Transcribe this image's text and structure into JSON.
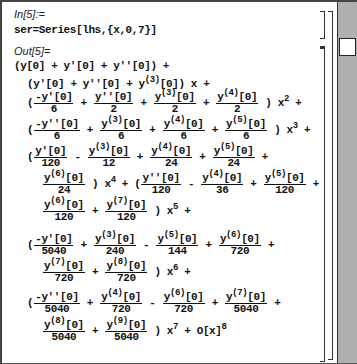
{
  "cell_in": {
    "label": "In[5]:=",
    "code": "ser=Series[lhs,{x,0,7}]"
  },
  "cell_out": {
    "label": "Out[5]=",
    "lines": [
      {
        "id": "l0",
        "text": "(y[0] + y'[0] + y''[0]) +"
      },
      {
        "id": "l1",
        "text": "(y'[0] + y''[0] + y(3)[0]) x +"
      }
    ],
    "terms": {
      "x2": [
        {
          "sign": "(",
          "num": "-y'[0]",
          "den": "6"
        },
        {
          "sign": "+",
          "num": "y''[0]",
          "den": "2"
        },
        {
          "sign": "+",
          "num": "y(3)[0]",
          "den": "2"
        },
        {
          "sign": "+",
          "num": "y(4)[0]",
          "den": "2"
        },
        {
          "tail": ") x^2 +"
        }
      ],
      "x3": [
        {
          "sign": "(",
          "num": "-y''[0]",
          "den": "6"
        },
        {
          "sign": "+",
          "num": "y(3)[0]",
          "den": "6"
        },
        {
          "sign": "+",
          "num": "y(4)[0]",
          "den": "6"
        },
        {
          "sign": "+",
          "num": "y(5)[0]",
          "den": "6"
        },
        {
          "tail": ") x^3 +"
        }
      ],
      "x4a": [
        {
          "sign": "(",
          "num": "y'[0]",
          "den": "120"
        },
        {
          "sign": "-",
          "num": "y(3)[0]",
          "den": "12"
        },
        {
          "sign": "+",
          "num": "y(4)[0]",
          "den": "24"
        },
        {
          "sign": "+",
          "num": "y(5)[0]",
          "den": "24"
        },
        {
          "tail": "+"
        }
      ],
      "x4b_x5a": [
        {
          "num": "y(6)[0]",
          "den": "24"
        },
        {
          "tail": ") x^4 + ("
        },
        {
          "num": "y''[0]",
          "den": "120"
        },
        {
          "sign": "-",
          "num": "y(4)[0]",
          "den": "36"
        },
        {
          "sign": "+",
          "num": "y(5)[0]",
          "den": "120"
        },
        {
          "tail": "+"
        }
      ],
      "x5b": [
        {
          "num": "y(6)[0]",
          "den": "120"
        },
        {
          "sign": "+",
          "num": "y(7)[0]",
          "den": "120"
        },
        {
          "tail": ") x^5 +"
        }
      ],
      "x6a": [
        {
          "sign": "(",
          "num": "-y'[0]",
          "den": "5040"
        },
        {
          "sign": "+",
          "num": "y(3)[0]",
          "den": "240"
        },
        {
          "sign": "-",
          "num": "y(5)[0]",
          "den": "144"
        },
        {
          "sign": "+",
          "num": "y(6)[0]",
          "den": "720"
        },
        {
          "tail": "+"
        }
      ],
      "x6b": [
        {
          "num": "y(7)[0]",
          "den": "720"
        },
        {
          "sign": "+",
          "num": "y(8)[0]",
          "den": "720"
        },
        {
          "tail": ") x^6 +"
        }
      ],
      "x7a": [
        {
          "sign": "(",
          "num": "-y''[0]",
          "den": "5040"
        },
        {
          "sign": "+",
          "num": "y(4)[0]",
          "den": "720"
        },
        {
          "sign": "-",
          "num": "y(6)[0]",
          "den": "720"
        },
        {
          "sign": "+",
          "num": "y(7)[0]",
          "den": "5040"
        },
        {
          "tail": "+"
        }
      ],
      "x7b": [
        {
          "num": "y(8)[0]",
          "den": "5040"
        },
        {
          "sign": "+",
          "num": "y(9)[0]",
          "den": "5040"
        },
        {
          "tail": ") x^7 + O[x]^8"
        }
      ]
    }
  },
  "scrollbar": {
    "thumb_position": "top"
  }
}
